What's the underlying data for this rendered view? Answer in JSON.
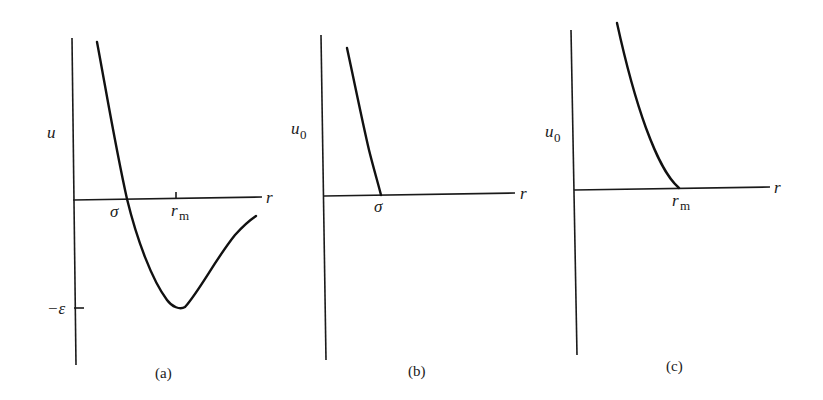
{
  "panels": [
    {
      "id": "a",
      "caption": "(a)",
      "y_label": "u",
      "y_label_sub": "",
      "x_label": "r",
      "marks": {
        "sigma": "σ",
        "r_m": "r",
        "r_m_sub": "m",
        "neg_epsilon": "−ε"
      },
      "description": "Full intermolecular potential with repulsive core and attractive well of depth ε at r_m"
    },
    {
      "id": "b",
      "caption": "(b)",
      "y_label": "u",
      "y_label_sub": "0",
      "x_label": "r",
      "marks": {
        "sigma": "σ"
      },
      "description": "Repulsive part of potential cut off at σ"
    },
    {
      "id": "c",
      "caption": "(c)",
      "y_label": "u",
      "y_label_sub": "0",
      "x_label": "r",
      "marks": {
        "r_m": "r",
        "r_m_sub": "m"
      },
      "description": "Repulsive part shifted so it reaches zero at r_m"
    }
  ],
  "colors": {
    "line": "#111111",
    "background": "#ffffff"
  }
}
